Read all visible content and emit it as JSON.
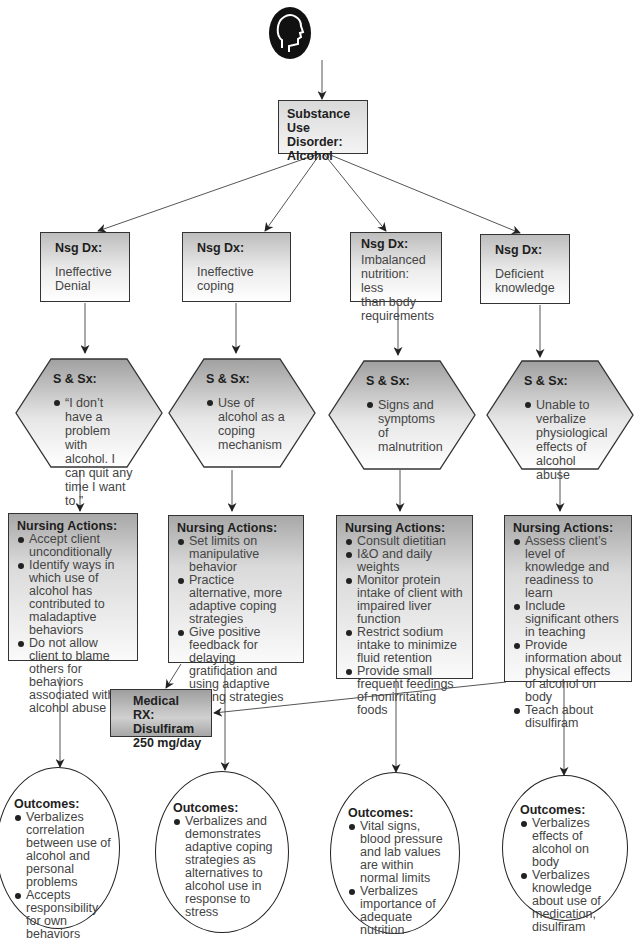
{
  "diagram": {
    "type": "nursing-care-concept-map",
    "root": {
      "label_lines": [
        "Substance Use",
        "Disorder:",
        "Alcohol"
      ],
      "icon": "human-head-profile-icon"
    },
    "branches": [
      {
        "dx": {
          "header": "Nsg Dx:",
          "text": "Ineffective Denial",
          "lines": [
            "Ineffective",
            "Denial"
          ]
        },
        "signs": {
          "header": "S & Sx:",
          "items": [
            "“I don’t have a problem with alcohol. I can quit any time I want to.”"
          ]
        },
        "actions": {
          "header": "Nursing Actions:",
          "items": [
            "Accept client unconditionally",
            "Identify ways in which use of alcohol has contributed to maladaptive behaviors",
            "Do not allow client to blame others for behaviors associated with alcohol abuse"
          ]
        },
        "outcomes": {
          "header": "Outcomes:",
          "items": [
            "Verbalizes correlation between use of alcohol and personal problems",
            "Accepts responsibility for own behaviors"
          ]
        }
      },
      {
        "dx": {
          "header": "Nsg Dx:",
          "text": "Ineffective coping",
          "lines": [
            "Ineffective coping"
          ]
        },
        "signs": {
          "header": "S & Sx:",
          "items": [
            "Use of alcohol as a coping mechanism"
          ]
        },
        "actions": {
          "header": "Nursing Actions:",
          "items": [
            "Set limits on manipulative behavior",
            "Practice alternative, more adaptive coping strategies",
            "Give positive feedback for delaying gratification and using adaptive coping strategies"
          ]
        },
        "outcomes": {
          "header": "Outcomes:",
          "items": [
            "Verbalizes and demonstrates adaptive coping strategies as alternatives to alcohol use in response to stress"
          ]
        }
      },
      {
        "dx": {
          "header": "Nsg Dx:",
          "text": "Imbalanced nutrition: less than body requirements",
          "lines": [
            "Imbalanced",
            "nutrition: less",
            "than body",
            "requirements"
          ]
        },
        "signs": {
          "header": "S & Sx:",
          "items": [
            "Signs and symptoms of malnutrition"
          ]
        },
        "actions": {
          "header": "Nursing Actions:",
          "items": [
            "Consult dietitian",
            "I&O and daily weights",
            "Monitor protein intake of client with impaired liver function",
            "Restrict sodium intake to minimize fluid retention",
            "Provide small frequent feedings of nonirritating foods"
          ]
        },
        "outcomes": {
          "header": "Outcomes:",
          "items": [
            "Vital signs, blood pressure and lab values are within normal limits",
            "Verbalizes importance of adequate nutrition"
          ]
        }
      },
      {
        "dx": {
          "header": "Nsg Dx:",
          "text": "Deficient knowledge",
          "lines": [
            "Deficient",
            "knowledge"
          ]
        },
        "signs": {
          "header": "S & Sx:",
          "items": [
            "Unable to verbalize physiological effects of alcohol abuse"
          ]
        },
        "actions": {
          "header": "Nursing Actions:",
          "items": [
            "Assess client’s level of knowledge and readiness to learn",
            "Include significant others in teaching",
            "Provide information about physical effects of alcohol on body",
            "Teach about disulfiram"
          ]
        },
        "outcomes": {
          "header": "Outcomes:",
          "items": [
            "Verbalizes effects of alcohol on body",
            "Verbalizes knowledge about use of medication, disulfiram"
          ]
        }
      }
    ],
    "medical_rx": {
      "lines": [
        "Medical RX:",
        "Disulfiram",
        "250 mg/day"
      ],
      "linked_from": [
        "Ineffective coping actions",
        "Deficient knowledge actions"
      ]
    },
    "colors": {
      "stroke": "#333333",
      "gradient_dark": "#a8a8a8",
      "gradient_light": "#ffffff",
      "icon_fill": "#111111"
    }
  }
}
